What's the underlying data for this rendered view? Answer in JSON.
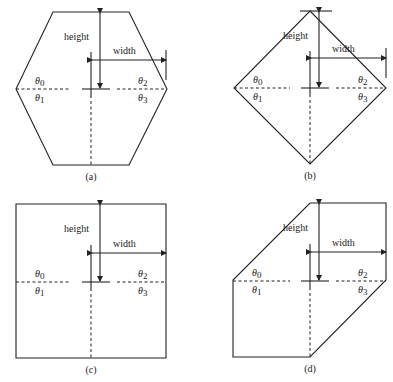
{
  "figure": {
    "panels": [
      {
        "id": "a",
        "caption": "(a)",
        "shape": "hexagon",
        "height_label": "height",
        "width_label": "width",
        "theta_labels": [
          "θ0",
          "θ1",
          "θ2",
          "θ3"
        ]
      },
      {
        "id": "b",
        "caption": "(b)",
        "shape": "diamond",
        "height_label": "height",
        "width_label": "width",
        "theta_labels": [
          "θ0",
          "θ1",
          "θ2",
          "θ3"
        ]
      },
      {
        "id": "c",
        "caption": "(c)",
        "shape": "square",
        "height_label": "height",
        "width_label": "width",
        "theta_labels": [
          "θ0",
          "θ1",
          "θ2",
          "θ3"
        ]
      },
      {
        "id": "d",
        "caption": "(d)",
        "shape": "parallelogram",
        "height_label": "height",
        "width_label": "width",
        "theta_labels": [
          "θ0",
          "θ1",
          "θ2",
          "θ3"
        ]
      }
    ],
    "theta_symbol": "θ",
    "theta_subscripts": [
      "0",
      "1",
      "2",
      "3"
    ],
    "colors": {
      "stroke": "#222222",
      "background": "#ffffff"
    }
  }
}
